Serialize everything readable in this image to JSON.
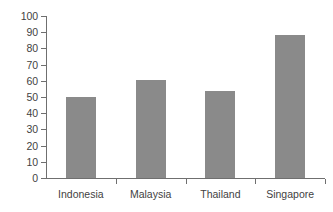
{
  "chart_data": {
    "type": "bar",
    "title": "",
    "xlabel": "",
    "ylabel": "",
    "categories": [
      "Indonesia",
      "Malaysia",
      "Thailand",
      "Singapore"
    ],
    "values": [
      50,
      60.5,
      54,
      88
    ],
    "ylim": [
      0,
      100
    ],
    "yticks": [
      0,
      10,
      20,
      30,
      40,
      50,
      60,
      70,
      80,
      90,
      100
    ],
    "ytick_labels": [
      "0",
      "10",
      "20",
      "30",
      "40",
      "50",
      "60",
      "70",
      "80",
      "90",
      "100"
    ],
    "grid": false,
    "legend": false,
    "bar_color": "#8a8a8a",
    "axis_color": "#6f6f6f",
    "text_color": "#3f3f3f",
    "background_color": "#ffffff"
  }
}
